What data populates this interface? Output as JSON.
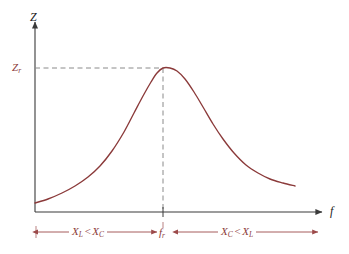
{
  "figure": {
    "background_color": "#ffffff",
    "width": 349,
    "height": 254
  },
  "axes": {
    "y_axis_label": "Z",
    "x_axis_label": "f",
    "axis_color": "#3a3a3a",
    "y_axis_x": 35,
    "x_axis_y": 212,
    "y_axis_top": 22,
    "x_axis_right": 322
  },
  "ticks": {
    "y_tick_label": "Z",
    "y_tick_subscript": "r",
    "x_tick_label": "f",
    "x_tick_subscript": "r",
    "tick_color": "#8d3b3b"
  },
  "guides": {
    "color": "#8a8a8a",
    "style": "dashed",
    "horizontal_at_peak": true,
    "vertical_at_peak": true
  },
  "annotations": {
    "left_range": {
      "lhs": "X",
      "lhs_sub": "L",
      "operator": "<",
      "rhs": "X",
      "rhs_sub": "C",
      "text": "XL < XC"
    },
    "right_range": {
      "lhs": "X",
      "lhs_sub": "C",
      "operator": "<",
      "rhs": "X",
      "rhs_sub": "L",
      "text": "XC < XL"
    },
    "arrow_color": "#9c4a4a"
  },
  "chart_data": {
    "type": "line",
    "title": "",
    "xlabel": "f",
    "ylabel": "Z",
    "grid": false,
    "legend": null,
    "series": [
      {
        "name": "Impedance magnitude Z(f)",
        "color": "#8b3a3a",
        "points": [
          [
            35,
            203
          ],
          [
            48,
            199
          ],
          [
            62,
            193
          ],
          [
            75,
            186
          ],
          [
            88,
            177
          ],
          [
            100,
            166
          ],
          [
            112,
            151
          ],
          [
            124,
            132
          ],
          [
            134,
            113
          ],
          [
            143,
            96
          ],
          [
            151,
            82
          ],
          [
            157,
            73
          ],
          [
            163,
            68
          ],
          [
            170,
            68
          ],
          [
            177,
            71
          ],
          [
            185,
            79
          ],
          [
            194,
            92
          ],
          [
            203,
            107
          ],
          [
            213,
            124
          ],
          [
            223,
            139
          ],
          [
            234,
            153
          ],
          [
            246,
            165
          ],
          [
            258,
            173
          ],
          [
            270,
            179
          ],
          [
            283,
            183
          ],
          [
            295,
            186
          ]
        ]
      }
    ],
    "annotations": [
      {
        "label": "Zr",
        "type": "y-level",
        "value_px": 68,
        "description": "Peak impedance at resonance"
      },
      {
        "label": "fr",
        "type": "x-level",
        "value_px": 163,
        "description": "Resonant frequency"
      },
      {
        "label": "XL < XC",
        "type": "region",
        "range_px": [
          38,
          157
        ],
        "description": "Below resonance, capacitive reactance dominates"
      },
      {
        "label": "XC < XL",
        "type": "region",
        "range_px": [
          178,
          318
        ],
        "description": "Above resonance, inductive reactance dominates"
      }
    ],
    "axis_ranges": {
      "x_px": [
        35,
        322
      ],
      "y_px": [
        212,
        22
      ]
    }
  }
}
